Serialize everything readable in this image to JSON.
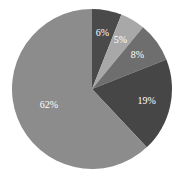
{
  "chart_data": {
    "type": "pie",
    "title": "",
    "start_angle": "12 o'clock",
    "direction": "clockwise",
    "slices": [
      {
        "label": "6%",
        "value": 6,
        "color": "#4a4a4a"
      },
      {
        "label": "5%",
        "value": 5,
        "color": "#a8a8a8"
      },
      {
        "label": "8%",
        "value": 8,
        "color": "#6e6e6e"
      },
      {
        "label": "19%",
        "value": 19,
        "color": "#464646"
      },
      {
        "label": "62%",
        "value": 62,
        "color": "#8c8c8c"
      }
    ],
    "legend": "none"
  }
}
